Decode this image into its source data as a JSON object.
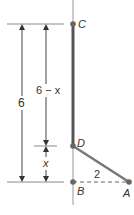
{
  "diagram": {
    "points": {
      "C": {
        "label": "C",
        "x": 73,
        "y": 24
      },
      "D": {
        "label": "D",
        "x": 73,
        "y": 146
      },
      "B": {
        "label": "B",
        "x": 73,
        "y": 182
      },
      "A": {
        "label": "A",
        "x": 129,
        "y": 182
      }
    },
    "dimensions": {
      "total": "6",
      "upper": "6 − x",
      "lower": "x",
      "base": "2"
    },
    "colors": {
      "line": "#888888",
      "thick_line": "#555555",
      "point": "#666666",
      "text": "#333333"
    }
  }
}
